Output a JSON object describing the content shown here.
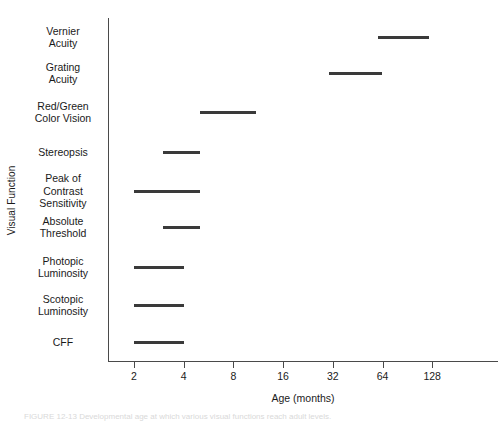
{
  "chart_data": {
    "type": "bar",
    "subtype": "horizontal-range-bar",
    "title": "",
    "xlabel": "Age (months)",
    "ylabel": "Visual Function",
    "xscale": "log2",
    "xlim": [
      1.7,
      160
    ],
    "grid": false,
    "legend": null,
    "xticks": [
      2,
      4,
      8,
      16,
      32,
      64,
      128
    ],
    "xtick_labels": [
      "2",
      "4",
      "8",
      "16",
      "32",
      "64",
      "128"
    ],
    "categories": [
      "Vernier Acuity",
      "Grating Acuity",
      "Red/Green Color Vision",
      "Stereopsis",
      "Peak of Contrast Sensitivity",
      "Absolute Threshold",
      "Photopic Luminosity",
      "Scotopic Luminosity",
      "CFF"
    ],
    "category_label_lines": [
      [
        "Vernier",
        "Acuity"
      ],
      [
        "Grating",
        "Acuity"
      ],
      [
        "Red/Green",
        "Color Vision"
      ],
      [
        "Stereopsis"
      ],
      [
        "Peak of",
        "Contrast",
        "Sensitivity"
      ],
      [
        "Absolute",
        "Threshold"
      ],
      [
        "Photopic",
        "Luminosity"
      ],
      [
        "Scotopic",
        "Luminosity"
      ],
      [
        "CFF"
      ]
    ],
    "ranges": [
      {
        "category": "Vernier Acuity",
        "start": 60.0,
        "end": 122.0,
        "unit": "months"
      },
      {
        "category": "Grating Acuity",
        "start": 30.5,
        "end": 64.0,
        "unit": "months"
      },
      {
        "category": "Red/Green Color Vision",
        "start": 5.0,
        "end": 11.0,
        "unit": "months"
      },
      {
        "category": "Stereopsis",
        "start": 3.0,
        "end": 5.0,
        "unit": "months"
      },
      {
        "category": "Peak of Contrast Sensitivity",
        "start": 2.0,
        "end": 5.0,
        "unit": "months"
      },
      {
        "category": "Absolute Threshold",
        "start": 3.0,
        "end": 5.0,
        "unit": "months"
      },
      {
        "category": "Photopic Luminosity",
        "start": 2.0,
        "end": 4.0,
        "unit": "months"
      },
      {
        "category": "Scotopic Luminosity",
        "start": 2.0,
        "end": 4.0,
        "unit": "months"
      },
      {
        "category": "CFF",
        "start": 2.0,
        "end": 4.0,
        "unit": "months"
      }
    ],
    "series": [
      {
        "name": "Age range of maturation",
        "starts": [
          60.0,
          30.5,
          5.0,
          3.0,
          2.0,
          3.0,
          2.0,
          2.0,
          2.0
        ],
        "ends": [
          122.0,
          64.0,
          11.0,
          5.0,
          5.0,
          5.0,
          4.0,
          4.0,
          4.0
        ]
      }
    ],
    "colors": {
      "bar": "#3a3a3a",
      "axis": "#4a4a4a",
      "text": "#1a1a1a",
      "background": "#ffffff"
    }
  },
  "axes": {
    "x_title": "Age (months)",
    "y_title": "Visual Function"
  },
  "caption": {
    "label": "FIGURE 12-13",
    "text": "FIGURE 12-13   Developmental age at which various visual functions reach adult levels."
  }
}
